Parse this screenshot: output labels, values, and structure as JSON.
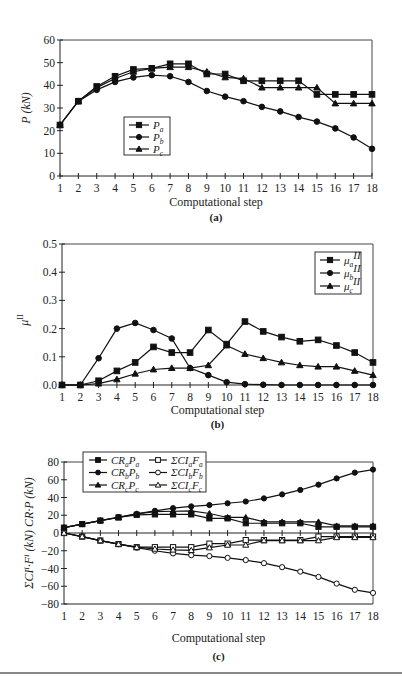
{
  "chart_data": [
    {
      "id": "a",
      "type": "line",
      "caption": "(a)",
      "title": "",
      "xlabel": "Computational step",
      "ylabel": "P (kN)",
      "x": [
        1,
        2,
        3,
        4,
        5,
        6,
        7,
        8,
        9,
        10,
        11,
        12,
        13,
        14,
        15,
        16,
        17,
        18
      ],
      "xticks": [
        "1",
        "2",
        "3",
        "4",
        "5",
        "6",
        "7",
        "8",
        "9",
        "10",
        "11",
        "12",
        "13",
        "14",
        "15",
        "16",
        "17",
        "18"
      ],
      "ylim": [
        0,
        60
      ],
      "yticks": [
        "0",
        "10",
        "20",
        "30",
        "40",
        "50",
        "60"
      ],
      "grid": false,
      "legend_position": "center-left",
      "series": [
        {
          "name": "P_a",
          "label": "P",
          "sub": "a",
          "marker": "square-filled",
          "values": [
            22.5,
            33,
            39.5,
            44,
            47,
            47.5,
            49.5,
            49.5,
            45,
            45,
            42,
            42,
            42,
            42,
            36,
            36,
            36,
            36
          ]
        },
        {
          "name": "P_b",
          "label": "P",
          "sub": "b",
          "marker": "circle-filled",
          "values": [
            22.5,
            33,
            38,
            41.5,
            43.5,
            44.5,
            44,
            41.5,
            37.5,
            35,
            33,
            30.5,
            28.5,
            26,
            24,
            21,
            17,
            12
          ]
        },
        {
          "name": "P_c",
          "label": "P",
          "sub": "c",
          "marker": "triangle-filled",
          "values": [
            22.5,
            33,
            39,
            43,
            46,
            47.5,
            48,
            48,
            46,
            43.5,
            43,
            39,
            39,
            39,
            39,
            32,
            32,
            32
          ]
        }
      ]
    },
    {
      "id": "b",
      "type": "line",
      "caption": "(b)",
      "title": "",
      "xlabel": "Computational step",
      "ylabel": "μII",
      "x": [
        1,
        2,
        3,
        4,
        5,
        6,
        7,
        8,
        9,
        10,
        11,
        12,
        13,
        14,
        15,
        16,
        17,
        18
      ],
      "xticks": [
        "1",
        "2",
        "3",
        "4",
        "5",
        "6",
        "7",
        "8",
        "9",
        "10",
        "11",
        "12",
        "13",
        "14",
        "15",
        "16",
        "17",
        "18"
      ],
      "ylim": [
        0,
        0.5
      ],
      "yticks": [
        "0.0",
        "0.1",
        "0.2",
        "0.3",
        "0.4",
        "0.5"
      ],
      "grid": false,
      "legend_position": "upper-right",
      "series": [
        {
          "name": "μ_a^II",
          "label": "μ",
          "sub": "a",
          "sup": "II",
          "marker": "square-filled",
          "values": [
            0,
            0,
            0.015,
            0.05,
            0.08,
            0.135,
            0.115,
            0.115,
            0.195,
            0.145,
            0.225,
            0.19,
            0.17,
            0.155,
            0.16,
            0.14,
            0.115,
            0.08
          ]
        },
        {
          "name": "μ_b^II",
          "label": "μ",
          "sub": "b",
          "sup": "II",
          "marker": "circle-filled",
          "values": [
            0,
            0,
            0.095,
            0.2,
            0.22,
            0.195,
            0.165,
            0.06,
            0.035,
            0.01,
            0.003,
            0.001,
            0,
            0,
            0,
            0,
            0,
            0
          ]
        },
        {
          "name": "μ_c^II",
          "label": "μ",
          "sub": "c",
          "sup": "II",
          "marker": "triangle-filled",
          "values": [
            0,
            0,
            0.005,
            0.02,
            0.04,
            0.055,
            0.06,
            0.06,
            0.07,
            0.14,
            0.11,
            0.095,
            0.08,
            0.07,
            0.065,
            0.065,
            0.05,
            0.035
          ]
        }
      ]
    },
    {
      "id": "c",
      "type": "line",
      "caption": "(c)",
      "title": "",
      "xlabel": "Computational step",
      "ylabel": "ΣCIⁱ·Fⁱ (kN) CR·P (kN)",
      "x": [
        1,
        2,
        3,
        4,
        5,
        6,
        7,
        8,
        9,
        10,
        11,
        12,
        13,
        14,
        15,
        16,
        17,
        18
      ],
      "xticks": [
        "1",
        "2",
        "3",
        "4",
        "5",
        "6",
        "7",
        "8",
        "9",
        "10",
        "11",
        "12",
        "13",
        "14",
        "15",
        "16",
        "17",
        "18"
      ],
      "ylim": [
        -80,
        80
      ],
      "yticks": [
        "80",
        "60",
        "40",
        "20",
        "0",
        "−20",
        "−40",
        "−60",
        "−80"
      ],
      "grid": false,
      "legend_position": "top",
      "series": [
        {
          "name": "CR_aP_a",
          "label": "CR",
          "sub": "a",
          "label2": "P",
          "sub2": "a",
          "marker": "square-filled",
          "values": [
            6,
            10,
            14,
            17.5,
            20.5,
            21,
            21,
            21,
            16.5,
            16.5,
            11,
            11,
            11,
            11,
            7,
            7,
            7,
            7
          ]
        },
        {
          "name": "CR_bP_b",
          "label": "CR",
          "sub": "b",
          "label2": "P",
          "sub2": "b",
          "marker": "circle-filled",
          "values": [
            6,
            10,
            14,
            18,
            21.5,
            25,
            28,
            30,
            31.5,
            33.5,
            35.5,
            39,
            43.5,
            48.5,
            54.5,
            61.5,
            68,
            71.5
          ]
        },
        {
          "name": "CR_cP_c",
          "label": "CR",
          "sub": "c",
          "label2": "P",
          "sub2": "c",
          "marker": "triangle-filled",
          "values": [
            6,
            10,
            14,
            17.5,
            21.5,
            24,
            24.5,
            25,
            22,
            17.5,
            17.5,
            12.5,
            12.5,
            12.5,
            12.5,
            8,
            8,
            8
          ]
        },
        {
          "name": "ΣCI_a^iF_a^i",
          "label": "ΣCI",
          "sub": "a",
          "label2": "F",
          "sub2": "a",
          "marker": "square-open",
          "values": [
            0,
            -4,
            -8.5,
            -12.5,
            -16,
            -16,
            -16,
            -16,
            -12,
            -12,
            -8,
            -8,
            -8,
            -8,
            -4,
            -4,
            -4,
            -4
          ]
        },
        {
          "name": "ΣCI_b^iF_b^i",
          "label": "ΣCI",
          "sub": "b",
          "label2": "F",
          "sub2": "b",
          "marker": "circle-open",
          "values": [
            0,
            -4,
            -8.5,
            -12.5,
            -16.5,
            -20,
            -23,
            -25,
            -26,
            -28,
            -30.5,
            -34,
            -38.5,
            -43.5,
            -49.5,
            -57,
            -64,
            -67.5
          ]
        },
        {
          "name": "ΣCI_c^iF_c^i",
          "label": "ΣCI",
          "sub": "c",
          "label2": "F",
          "sub2": "c",
          "marker": "triangle-open",
          "values": [
            0,
            -4,
            -8.5,
            -12.5,
            -16,
            -18,
            -19,
            -19.5,
            -16.5,
            -13.5,
            -13.5,
            -8.5,
            -8.5,
            -8.5,
            -8.5,
            -5,
            -5,
            -5
          ]
        }
      ]
    }
  ],
  "captions": {
    "a": "(a)",
    "b": "(b)",
    "c": "(c)"
  },
  "axis_titles": {
    "a_x": "Computational step",
    "a_y": "P (kN)",
    "b_x": "Computational step",
    "b_y": "μ",
    "b_y_sup": "II",
    "c_x": "Computational step",
    "c_y": "ΣCIⁱ·Fⁱ (kN) CR·P (kN)"
  }
}
